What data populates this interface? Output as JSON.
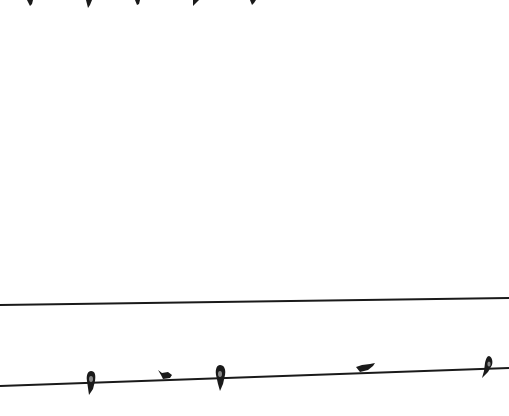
{
  "scene": {
    "description": "Grayscale photo of swallows perched on power lines against a white sky",
    "background_color": "#ffffff",
    "ink_color": "#1a1a1a",
    "top_bird_count": 5,
    "lower_wire_bird_count": 5
  }
}
